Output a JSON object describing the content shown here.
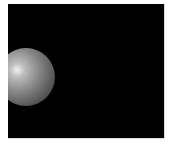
{
  "scene": {
    "background_color": "#000000",
    "frame_color": "#ffffff",
    "objects": [
      {
        "type": "sphere",
        "shading": "gray-lit",
        "highlight_color": "#f2f2f2",
        "shadow_color": "#2a2a2a"
      }
    ]
  }
}
